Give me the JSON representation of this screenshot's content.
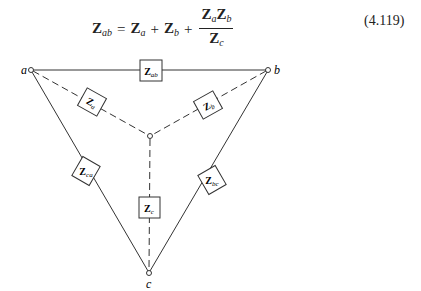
{
  "equation": {
    "lhs": {
      "symbol": "Z",
      "sub": "ab"
    },
    "equals": "=",
    "terms": [
      {
        "symbol": "Z",
        "sub": "a"
      },
      {
        "op": "+"
      },
      {
        "symbol": "Z",
        "sub": "b"
      },
      {
        "op": "+"
      }
    ],
    "fraction": {
      "numerator": [
        {
          "symbol": "Z",
          "sub": "a"
        },
        {
          "symbol": "Z",
          "sub": "b"
        }
      ],
      "denominator": {
        "symbol": "Z",
        "sub": "c"
      }
    },
    "number": "(4.119)"
  },
  "diagram": {
    "nodes": {
      "a": {
        "label": "a",
        "x": 31,
        "y": 70
      },
      "b": {
        "label": "b",
        "x": 268,
        "y": 70
      },
      "c": {
        "label": "c",
        "x": 149,
        "y": 273
      },
      "center": {
        "label": "",
        "x": 150,
        "y": 136
      }
    },
    "impedances": {
      "ab": {
        "symbol": "Z",
        "sub": "ab",
        "type": "delta"
      },
      "bc": {
        "symbol": "Z",
        "sub": "bc",
        "type": "delta"
      },
      "ca": {
        "symbol": "Z",
        "sub": "ca",
        "type": "delta"
      },
      "a": {
        "symbol": "Z",
        "sub": "a",
        "type": "wye"
      },
      "b": {
        "symbol": "Z",
        "sub": "b",
        "type": "wye"
      },
      "c": {
        "symbol": "Z",
        "sub": "c",
        "type": "wye"
      }
    }
  }
}
